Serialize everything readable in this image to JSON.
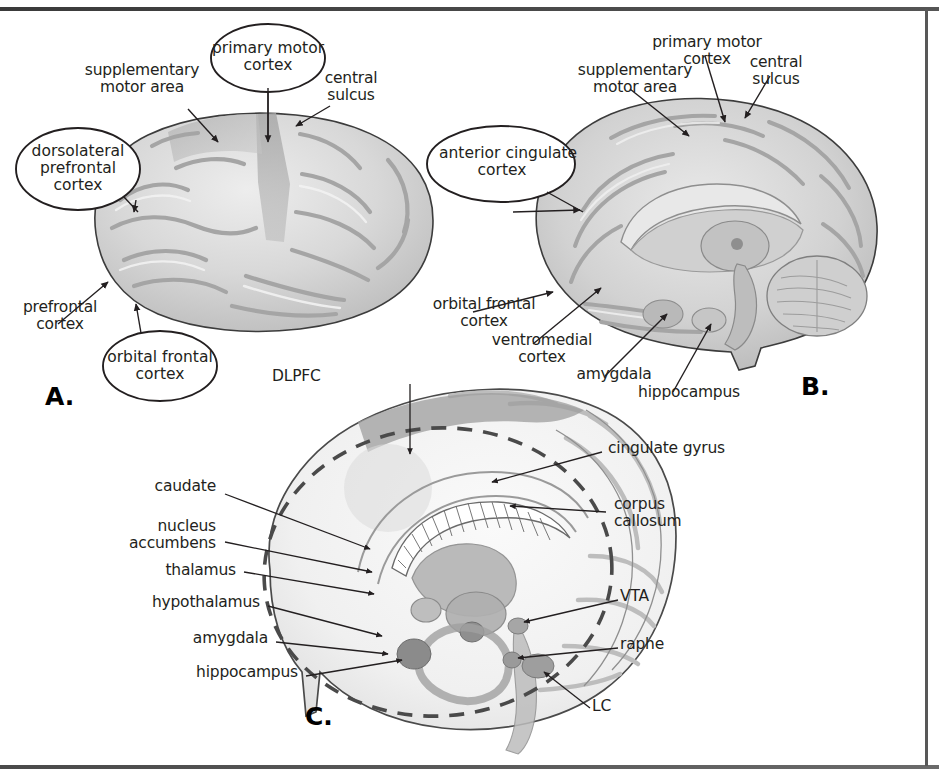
{
  "figure": {
    "background_color": "#ffffff",
    "frame_color": "#4a4a4a",
    "text_color": "#231f20",
    "brain_fill_light": "#e3e3e3",
    "brain_fill_mid": "#c9c9c9",
    "brain_fill_dark": "#a8a8a8",
    "brain_outline": "#3c3c3c"
  },
  "panels": [
    {
      "id": "A",
      "letter": "A.",
      "view": "lateral surface of left hemisphere",
      "callouts": [
        {
          "name": "primary-motor-cortex",
          "label": "primary motor\ncortex"
        },
        {
          "name": "dorsolateral-prefrontal-cortex",
          "label": "dorsolateral\nprefrontal\ncortex"
        },
        {
          "name": "orbital-frontal-cortex",
          "label": "orbital frontal\ncortex"
        }
      ],
      "labels": [
        {
          "name": "supplementary-motor-area",
          "label": "supplementary\nmotor area"
        },
        {
          "name": "central-sulcus",
          "label": "central\nsulcus"
        },
        {
          "name": "prefrontal-cortex",
          "label": "prefrontal\ncortex"
        }
      ]
    },
    {
      "id": "B",
      "letter": "B.",
      "view": "midsagittal section",
      "callouts": [
        {
          "name": "anterior-cingulate-cortex",
          "label": "anterior cingulate\ncortex"
        }
      ],
      "labels": [
        {
          "name": "primary-motor-cortex",
          "label": "primary motor\ncortex"
        },
        {
          "name": "supplementary-motor-area",
          "label": "supplementary\nmotor area"
        },
        {
          "name": "central-sulcus",
          "label": "central\nsulcus"
        },
        {
          "name": "orbital-frontal-cortex",
          "label": "orbital frontal\ncortex"
        },
        {
          "name": "ventromedial-cortex",
          "label": "ventromedial\ncortex"
        },
        {
          "name": "amygdala",
          "label": "amygdala"
        },
        {
          "name": "hippocampus",
          "label": "hippocampus"
        }
      ]
    },
    {
      "id": "C",
      "letter": "C.",
      "view": "cutaway showing limbic structures",
      "callouts": [],
      "labels": [
        {
          "name": "dlpfc",
          "label": "DLPFC"
        },
        {
          "name": "caudate",
          "label": "caudate"
        },
        {
          "name": "nucleus-accumbens",
          "label": "nucleus\naccumbens"
        },
        {
          "name": "thalamus",
          "label": "thalamus"
        },
        {
          "name": "hypothalamus",
          "label": "hypothalamus"
        },
        {
          "name": "amygdala",
          "label": "amygdala"
        },
        {
          "name": "hippocampus",
          "label": "hippocampus"
        },
        {
          "name": "cingulate-gyrus",
          "label": "cingulate gyrus"
        },
        {
          "name": "corpus-callosum",
          "label": "corpus\ncallosum"
        },
        {
          "name": "vta",
          "label": "VTA"
        },
        {
          "name": "raphe",
          "label": "raphe"
        },
        {
          "name": "lc",
          "label": "LC"
        }
      ]
    }
  ]
}
